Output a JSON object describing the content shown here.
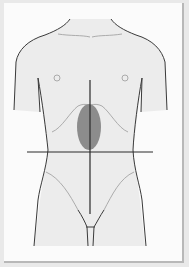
{
  "figure": {
    "highlighted_region": "epigastric",
    "colors": {
      "background": "#e9e9e9",
      "panel": "#fbfbfb",
      "body_fill": "#ececec",
      "outline": "#3a3a3a",
      "contour": "#9a9a9a",
      "highlight": "#8c8c8c",
      "axis_lines": "#2a2a2a"
    }
  }
}
